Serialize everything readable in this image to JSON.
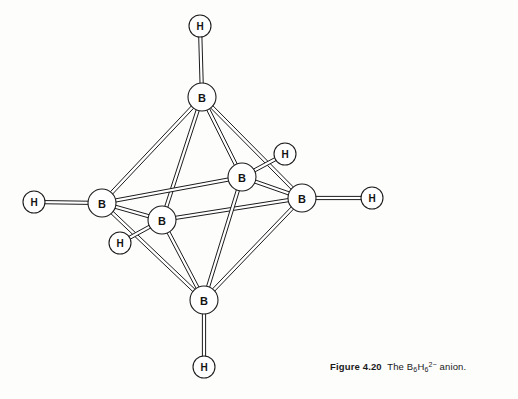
{
  "figure": {
    "caption_number": "Figure 4.20",
    "caption_text_before": "The B",
    "caption_sub_1": "6",
    "caption_mid": "H",
    "caption_sub_2": "6",
    "caption_charge": "2−",
    "caption_text_after": " anion.",
    "caption_full": "Figure 4.20  The B6H62− anion.",
    "formula": "B6H6 2-",
    "geometry": "octahedron",
    "colors": {
      "stroke": "#1c1c1c",
      "atom_fill": "#ffffff",
      "background": "#fdfdfc",
      "label": "#131313"
    }
  },
  "diagram": {
    "type": "molecular-structure",
    "boron_atoms": [
      {
        "id": "b-top",
        "label": "B",
        "x": 202,
        "y": 97,
        "r": 14,
        "position": "top-apex"
      },
      {
        "id": "b-left",
        "label": "B",
        "x": 102,
        "y": 203,
        "r": 14,
        "position": "left-equatorial"
      },
      {
        "id": "b-back",
        "label": "B",
        "x": 242,
        "y": 177,
        "r": 14,
        "position": "back-equatorial"
      },
      {
        "id": "b-front",
        "label": "B",
        "x": 162,
        "y": 220,
        "r": 14,
        "position": "front-equatorial"
      },
      {
        "id": "b-right",
        "label": "B",
        "x": 302,
        "y": 198,
        "r": 14,
        "position": "right-equatorial"
      },
      {
        "id": "b-bottom",
        "label": "B",
        "x": 204,
        "y": 300,
        "r": 14,
        "position": "bottom-apex"
      }
    ],
    "hydrogen_atoms": [
      {
        "id": "h-top",
        "label": "H",
        "x": 200,
        "y": 26,
        "r": 11,
        "bonded_to": "b-top"
      },
      {
        "id": "h-left",
        "label": "H",
        "x": 34,
        "y": 202,
        "r": 11,
        "bonded_to": "b-left"
      },
      {
        "id": "h-back",
        "label": "H",
        "x": 285,
        "y": 154,
        "r": 11,
        "bonded_to": "b-back"
      },
      {
        "id": "h-front",
        "label": "H",
        "x": 120,
        "y": 243,
        "r": 11,
        "bonded_to": "b-front"
      },
      {
        "id": "h-right",
        "label": "H",
        "x": 372,
        "y": 198,
        "r": 11,
        "bonded_to": "b-right"
      },
      {
        "id": "h-bottom",
        "label": "H",
        "x": 204,
        "y": 367,
        "r": 11,
        "bonded_to": "b-bottom"
      }
    ],
    "cage_bonds": [
      {
        "from": "b-top",
        "to": "b-left"
      },
      {
        "from": "b-top",
        "to": "b-back"
      },
      {
        "from": "b-top",
        "to": "b-front"
      },
      {
        "from": "b-top",
        "to": "b-right"
      },
      {
        "from": "b-left",
        "to": "b-back"
      },
      {
        "from": "b-back",
        "to": "b-right"
      },
      {
        "from": "b-right",
        "to": "b-front"
      },
      {
        "from": "b-front",
        "to": "b-left"
      },
      {
        "from": "b-bottom",
        "to": "b-left"
      },
      {
        "from": "b-bottom",
        "to": "b-back"
      },
      {
        "from": "b-bottom",
        "to": "b-front"
      },
      {
        "from": "b-bottom",
        "to": "b-right"
      }
    ],
    "terminal_bonds": [
      {
        "from": "b-top",
        "to": "h-top"
      },
      {
        "from": "b-left",
        "to": "h-left"
      },
      {
        "from": "b-back",
        "to": "h-back"
      },
      {
        "from": "b-front",
        "to": "h-front"
      },
      {
        "from": "b-right",
        "to": "h-right"
      },
      {
        "from": "b-bottom",
        "to": "h-bottom"
      }
    ],
    "bond_style": "double-line-tube",
    "bond_half_width": 1.6,
    "stroke_width": 1.0
  }
}
